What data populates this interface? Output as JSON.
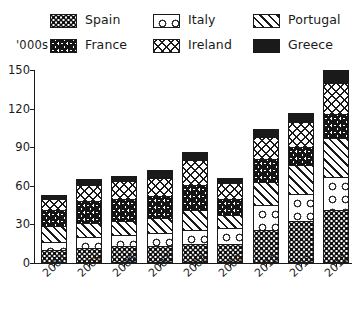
{
  "chart_data": {
    "type": "bar",
    "subtype": "stacked-vertical",
    "title": "",
    "xlabel": "",
    "ylabel": "'000s",
    "ylim": [
      0,
      150
    ],
    "yticks": [
      0,
      30,
      60,
      90,
      120,
      150
    ],
    "grid": false,
    "legend_position": "top",
    "stack_order_bottom_to_top": [
      "Spain",
      "Italy",
      "Portugal",
      "France",
      "Ireland",
      "Greece"
    ],
    "categories": [
      "2004",
      "2005",
      "2006",
      "2007",
      "2008",
      "2009",
      "2010",
      "2011",
      "2012"
    ],
    "series": [
      {
        "name": "Spain",
        "pattern": "dense-dots",
        "values": [
          10,
          12,
          13,
          13,
          15,
          15,
          26,
          33,
          41
        ]
      },
      {
        "name": "Italy",
        "pattern": "sparse-circles",
        "values": [
          6,
          8,
          9,
          10,
          11,
          12,
          19,
          21,
          26
        ]
      },
      {
        "name": "Portugal",
        "pattern": "diagonal-stripes",
        "values": [
          13,
          11,
          11,
          12,
          15,
          10,
          18,
          22,
          30
        ]
      },
      {
        "name": "France",
        "pattern": "squiggles",
        "values": [
          12,
          17,
          17,
          17,
          20,
          13,
          18,
          14,
          19
        ]
      },
      {
        "name": "Ireland",
        "pattern": "crosshatch",
        "values": [
          9,
          13,
          14,
          14,
          19,
          12,
          17,
          20,
          24
        ]
      },
      {
        "name": "Greece",
        "pattern": "solid-black",
        "values": [
          3,
          4,
          4,
          6,
          6,
          4,
          6,
          7,
          10
        ]
      }
    ],
    "totals": [
      53,
      65,
      68,
      72,
      86,
      66,
      104,
      117,
      150
    ]
  },
  "legend": {
    "rows": [
      [
        {
          "label": "Spain",
          "pattern": "p-spain"
        },
        {
          "label": "Italy",
          "pattern": "p-italy"
        },
        {
          "label": "Portugal",
          "pattern": "p-portugal"
        }
      ],
      [
        {
          "label": "France",
          "pattern": "p-france"
        },
        {
          "label": "Ireland",
          "pattern": "p-ireland"
        },
        {
          "label": "Greece",
          "pattern": "p-greece"
        }
      ]
    ]
  },
  "axis": {
    "units_label": "'000s",
    "y_tick_labels": [
      "0",
      "30",
      "60",
      "90",
      "120",
      "150"
    ],
    "x_tick_labels": [
      "2004",
      "2005",
      "2006",
      "2007",
      "2008",
      "2009",
      "2010",
      "2011",
      "2012"
    ]
  },
  "colors": {
    "ink": "#1a1a1a",
    "paper": "#ffffff",
    "greece_fill": "#1a1a1a"
  }
}
